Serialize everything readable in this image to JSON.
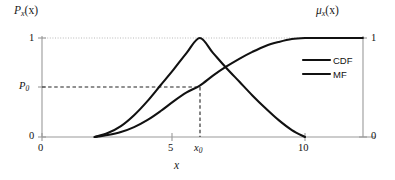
{
  "chart_data": {
    "type": "line",
    "title": "",
    "xlabel": "x",
    "ylabel_left": "P_x(x)",
    "ylabel_right": "μ_x(x)",
    "xlim": [
      0,
      12.2
    ],
    "ylim": [
      0,
      1.12
    ],
    "x_ticks": [
      {
        "value": 0,
        "label": "0"
      },
      {
        "value": 5,
        "label": "5"
      },
      {
        "value": 6,
        "label": "x₀"
      },
      {
        "value": 10,
        "label": "10"
      }
    ],
    "y_ticks_left": [
      {
        "value": 1,
        "label": "1"
      },
      {
        "value": 0.5,
        "label": "P₀"
      },
      {
        "value": 0,
        "label": "0"
      }
    ],
    "y_ticks_right": [
      {
        "value": 1,
        "label": "1"
      },
      {
        "value": 0,
        "label": "0"
      }
    ],
    "grid": "partial-dotted",
    "legend_position": "upper-right-inside",
    "annotations": {
      "x0_value": 6,
      "p0_value": 0.5,
      "guide_lines": [
        "horizontal dashed at P₀",
        "vertical dashed at x₀",
        "dotted gridline at 1"
      ]
    },
    "series": [
      {
        "name": "CDF",
        "color": "#111111",
        "x": [
          2.0,
          2.5,
          3.0,
          3.5,
          4.0,
          4.5,
          5.0,
          5.5,
          6.0,
          6.5,
          7.0,
          7.5,
          8.0,
          8.5,
          9.0,
          9.5,
          10.0,
          10.5,
          11.0,
          11.5,
          12.2
        ],
        "y": [
          0.0,
          0.02,
          0.05,
          0.1,
          0.17,
          0.26,
          0.36,
          0.45,
          0.52,
          0.62,
          0.71,
          0.79,
          0.86,
          0.92,
          0.96,
          0.99,
          1.0,
          1.0,
          1.0,
          1.0,
          1.0
        ]
      },
      {
        "name": "MF",
        "color": "#111111",
        "x": [
          2.0,
          2.5,
          3.0,
          3.5,
          4.0,
          4.5,
          5.0,
          5.5,
          6.0,
          6.5,
          7.0,
          7.5,
          8.0,
          8.5,
          9.0,
          9.5,
          10.0
        ],
        "y": [
          0.0,
          0.04,
          0.11,
          0.22,
          0.36,
          0.52,
          0.68,
          0.85,
          1.0,
          0.85,
          0.7,
          0.56,
          0.42,
          0.29,
          0.17,
          0.07,
          0.0
        ]
      }
    ]
  },
  "legend": {
    "items": [
      {
        "label": "CDF"
      },
      {
        "label": "MF"
      }
    ]
  },
  "labels": {
    "y_left_main": "P",
    "y_left_sub": "x",
    "y_left_arg": "(x)",
    "y_right_main": "μ",
    "y_right_sub": "x",
    "y_right_arg": "(x)",
    "x_axis": "x",
    "tick_y_top": "1",
    "tick_y_p0_main": "P",
    "tick_y_p0_sub": "0",
    "tick_y_bottom": "0",
    "tick_y_right_top": "1",
    "tick_y_right_bottom": "0",
    "tick_x_0": "0",
    "tick_x_5": "5",
    "tick_x_x0_main": "x",
    "tick_x_x0_sub": "0",
    "tick_x_10": "10"
  }
}
